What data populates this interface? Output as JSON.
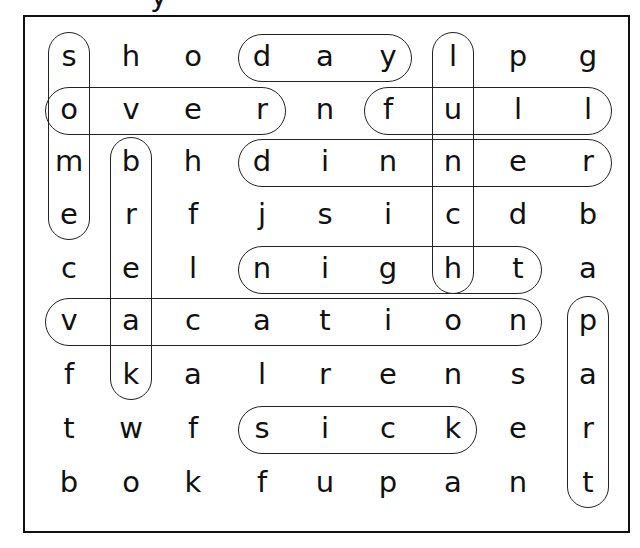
{
  "title_fragment": "y",
  "grid": {
    "rows": 9,
    "cols": 9,
    "col_centers": [
      69,
      131,
      193,
      262,
      325,
      388,
      453,
      518,
      588
    ],
    "row_centers": [
      58,
      111,
      163,
      216,
      270,
      322,
      376,
      430,
      484
    ],
    "letters": [
      [
        "s",
        "h",
        "o",
        "d",
        "a",
        "y",
        "l",
        "p",
        "g"
      ],
      [
        "o",
        "v",
        "e",
        "r",
        "n",
        "f",
        "u",
        "l",
        "l"
      ],
      [
        "m",
        "b",
        "h",
        "d",
        "i",
        "n",
        "n",
        "e",
        "r"
      ],
      [
        "e",
        "r",
        "f",
        "j",
        "s",
        "i",
        "c",
        "d",
        "b"
      ],
      [
        "c",
        "e",
        "l",
        "n",
        "i",
        "g",
        "h",
        "t",
        "a"
      ],
      [
        "v",
        "a",
        "c",
        "a",
        "t",
        "i",
        "o",
        "n",
        "p"
      ],
      [
        "f",
        "k",
        "a",
        "l",
        "r",
        "e",
        "n",
        "s",
        "a"
      ],
      [
        "t",
        "w",
        "f",
        "s",
        "i",
        "c",
        "k",
        "e",
        "r"
      ],
      [
        "b",
        "o",
        "k",
        "f",
        "u",
        "p",
        "a",
        "n",
        "t"
      ]
    ]
  },
  "found_words": [
    {
      "word": "day",
      "direction": "horizontal",
      "row": 0,
      "start": 3,
      "end": 5
    },
    {
      "word": "over",
      "direction": "horizontal",
      "row": 1,
      "start": 0,
      "end": 3
    },
    {
      "word": "full",
      "direction": "horizontal",
      "row": 1,
      "start": 5,
      "end": 8
    },
    {
      "word": "dinner",
      "direction": "horizontal",
      "row": 2,
      "start": 3,
      "end": 8
    },
    {
      "word": "night",
      "direction": "horizontal",
      "row": 4,
      "start": 3,
      "end": 7
    },
    {
      "word": "vacation",
      "direction": "horizontal",
      "row": 5,
      "start": 0,
      "end": 7
    },
    {
      "word": "sick",
      "direction": "horizontal",
      "row": 7,
      "start": 3,
      "end": 6
    },
    {
      "word": "some",
      "direction": "vertical",
      "col": 0,
      "start": 0,
      "end": 3
    },
    {
      "word": "lunch",
      "direction": "vertical",
      "col": 6,
      "start": 0,
      "end": 4
    },
    {
      "word": "break",
      "direction": "vertical",
      "col": 1,
      "start": 2,
      "end": 6
    },
    {
      "word": "part",
      "direction": "vertical",
      "col": 8,
      "start": 5,
      "end": 8
    }
  ],
  "colors": {
    "ink": "#111111",
    "ring": "#222222",
    "background": "#ffffff"
  }
}
